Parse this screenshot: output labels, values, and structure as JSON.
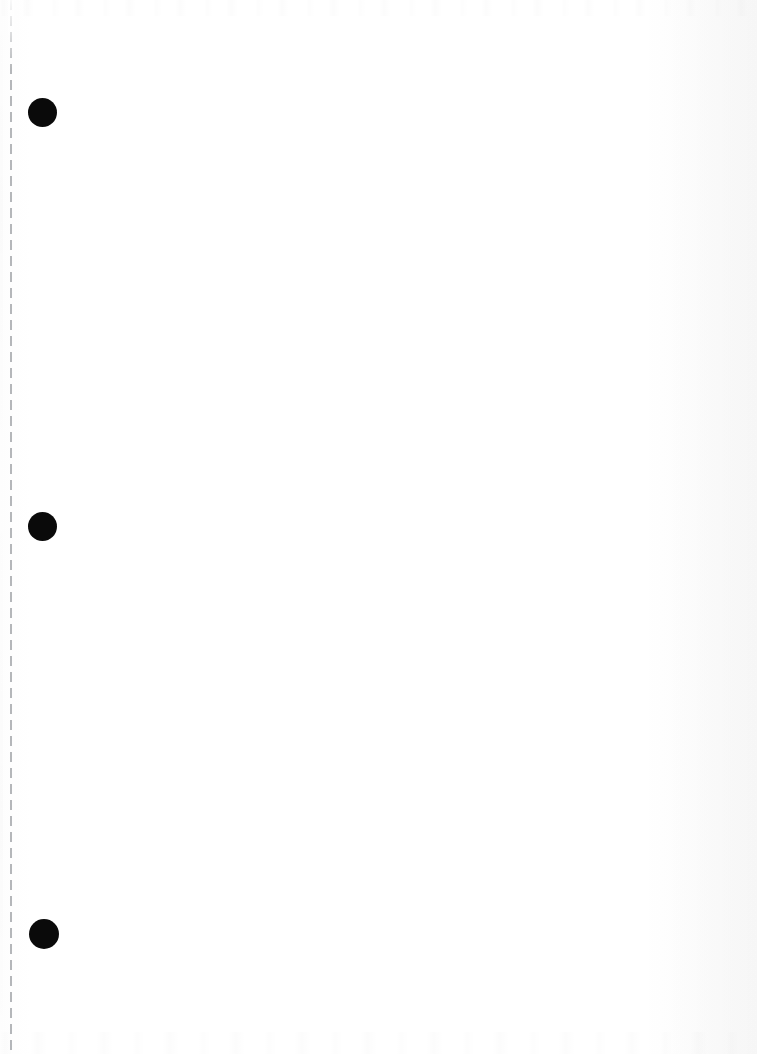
{
  "page": {
    "kind": "scanned-blank-page",
    "width": 757,
    "height": 1054,
    "background_color": "#ffffff",
    "ink_color": "#0a0a0a",
    "rule_color": "#787c82",
    "caption": ""
  },
  "margin_rule": {
    "name": "vertical-dashed-margin-line",
    "x": 10,
    "top": 0,
    "bottom": 1054,
    "thickness": 2,
    "dash_length": 10,
    "gap_length": 6,
    "color": "#787c82",
    "label": ""
  },
  "hole_markers": [
    {
      "name": "hole-marker-1",
      "cx": 42,
      "cy": 112,
      "diameter": 29,
      "color": "#0a0a0a",
      "label": ""
    },
    {
      "name": "hole-marker-2",
      "cx": 42,
      "cy": 526,
      "diameter": 29,
      "color": "#0a0a0a",
      "label": ""
    },
    {
      "name": "hole-marker-3",
      "cx": 44,
      "cy": 934,
      "diameter": 30,
      "color": "#0a0a0a",
      "label": ""
    }
  ],
  "content": {
    "body_text": "",
    "notes": ""
  }
}
